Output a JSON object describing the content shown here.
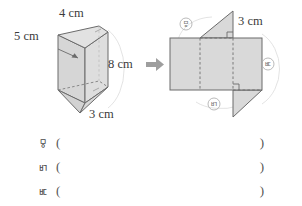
{
  "figure": {
    "prism": {
      "name": "triangular-prism",
      "labels": [
        {
          "id": "top-edge",
          "text": "4 cm"
        },
        {
          "id": "slant-edge",
          "text": "5 cm"
        },
        {
          "id": "height-edge",
          "text": "8 cm"
        },
        {
          "id": "base-edge",
          "text": "3 cm"
        }
      ]
    },
    "arrow": {
      "glyph": "➡",
      "direction": "right"
    },
    "net": {
      "name": "prism-net",
      "dimension_label": "3 cm",
      "part_labels": [
        {
          "id": "a",
          "text": "ㅱ"
        },
        {
          "id": "b",
          "text": "ㅲ"
        },
        {
          "id": "c",
          "text": "ㅳ"
        }
      ]
    }
  },
  "answers": {
    "rows": [
      {
        "marker": "ㅱ",
        "open": "(",
        "value": "",
        "close": ")"
      },
      {
        "marker": "ㅲ",
        "open": "(",
        "value": "",
        "close": ")"
      },
      {
        "marker": "ㅳ",
        "open": "(",
        "value": "",
        "close": ")"
      }
    ]
  },
  "colors": {
    "face_fill": "#d9d9d9",
    "face_fill_light": "#e0e0e0",
    "stroke": "#6b6b6b",
    "dashed": "#8a8a8a",
    "arc": "#d0d0d0",
    "text": "#3b3b3b",
    "label_text": "#7a7a7a",
    "arrow": "#9a9a9a",
    "background": "#ffffff"
  }
}
